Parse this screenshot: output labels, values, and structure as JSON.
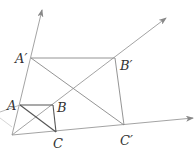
{
  "diagram": {
    "type": "geometric-homothety",
    "points": {
      "O": {
        "x": 12,
        "y": 135
      },
      "A": {
        "x": 20,
        "y": 105,
        "label": "A"
      },
      "B": {
        "x": 53,
        "y": 105,
        "label": "B"
      },
      "C": {
        "x": 56,
        "y": 132,
        "label": "C"
      },
      "A_prime": {
        "x": 31,
        "y": 58,
        "label": "A′"
      },
      "B_prime": {
        "x": 115,
        "y": 58,
        "label": "B′"
      },
      "C_prime": {
        "x": 124,
        "y": 125,
        "label": "C′"
      }
    },
    "labels": {
      "A": "A",
      "B": "B",
      "C": "C",
      "A_prime": "A′",
      "B_prime": "B′",
      "C_prime": "C′"
    },
    "colors": {
      "ray": "#9a9a9a",
      "small_triangle": "#555555",
      "large_quad": "#888888"
    }
  }
}
